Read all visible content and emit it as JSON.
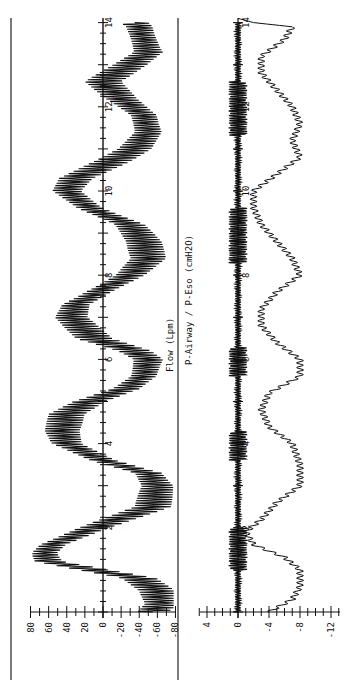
{
  "figure": {
    "orientation": "rotated-90-ccw",
    "ink_color": "#111111",
    "background": "#ffffff"
  },
  "panels": {
    "flow": {
      "title": "Flow (Lpm)",
      "y_ticks": [
        "80",
        "60",
        "40",
        "20",
        "0",
        "-20",
        "-40",
        "-60",
        "-80"
      ],
      "time_ticks": [
        "2",
        "4",
        "6",
        "8",
        "10",
        "12",
        "14"
      ]
    },
    "pressure": {
      "title": "P-Airway / P-Eso (cmH2O)",
      "y_ticks": [
        "4",
        "0",
        "-4",
        "-8",
        "-12"
      ],
      "time_ticks": [
        "2",
        "4",
        "6",
        "8",
        "10",
        "12",
        "14"
      ]
    }
  },
  "chart_data": [
    {
      "type": "line",
      "title": "Flow (Lpm)",
      "xlabel": "Time (s)",
      "ylabel": "Flow (Lpm)",
      "xlim": [
        0,
        14.2
      ],
      "ylim": [
        -80,
        80
      ],
      "x_ticks": [
        2,
        4,
        6,
        8,
        10,
        12,
        14
      ],
      "y_ticks": [
        80,
        60,
        40,
        20,
        0,
        -20,
        -40,
        -60,
        -80
      ],
      "grid": false,
      "note": "Breathing flow signal with superimposed high-frequency oscillation (~18 Hz band, amplitude ~ +/-20 Lpm). Values below are the slow envelope center.",
      "series": [
        {
          "name": "Flow envelope (center)",
          "x": [
            0.0,
            0.2,
            0.5,
            0.8,
            1.0,
            1.2,
            1.4,
            1.6,
            2.0,
            2.5,
            3.0,
            3.3,
            3.6,
            4.0,
            4.3,
            4.7,
            5.0,
            5.3,
            5.6,
            6.0,
            6.2,
            6.5,
            7.0,
            7.3,
            7.6,
            8.0,
            8.4,
            8.8,
            9.2,
            9.6,
            10.0,
            10.3,
            10.7,
            11.0,
            11.4,
            11.8,
            12.2,
            12.6,
            13.0,
            13.3,
            13.6,
            13.9,
            14.0
          ],
          "y": [
            -55,
            -65,
            -60,
            -40,
            10,
            60,
            65,
            55,
            10,
            -55,
            -60,
            -50,
            0,
            40,
            45,
            40,
            15,
            -25,
            -45,
            -50,
            -35,
            10,
            35,
            30,
            5,
            -30,
            -50,
            -45,
            -30,
            15,
            40,
            30,
            -10,
            -35,
            -50,
            -45,
            -20,
            0,
            -30,
            -50,
            -45,
            -40,
            -35
          ]
        },
        {
          "name": "HF oscillation amplitude",
          "x": [
            0,
            14
          ],
          "y": [
            20,
            20
          ]
        }
      ]
    },
    {
      "type": "line",
      "title": "P-Airway / P-Eso (cmH2O)",
      "xlabel": "Time (s)",
      "ylabel": "Pressure (cmH2O)",
      "xlim": [
        0,
        14.2
      ],
      "ylim": [
        -13,
        5
      ],
      "x_ticks": [
        2,
        4,
        6,
        8,
        10,
        12,
        14
      ],
      "y_ticks": [
        4,
        0,
        -4,
        -8,
        -12
      ],
      "grid": false,
      "series": [
        {
          "name": "P-Airway",
          "x": [
            0,
            2,
            4,
            6,
            8,
            10,
            12,
            14
          ],
          "y": [
            0,
            0,
            0,
            0,
            0,
            0,
            0,
            0
          ],
          "note": "Oscillates around 0 with amplitude ~ +/-1 cmH2O, larger bursts near t=1.5, 4, 6, 8.5-9.5, 11.5-12.5"
        },
        {
          "name": "P-Eso",
          "x": [
            0.0,
            0.3,
            0.6,
            1.0,
            1.3,
            1.6,
            1.9,
            2.2,
            2.6,
            3.0,
            3.5,
            4.0,
            4.4,
            4.8,
            5.2,
            5.6,
            6.0,
            6.4,
            6.8,
            7.2,
            7.6,
            8.0,
            8.4,
            8.8,
            9.2,
            9.6,
            10.0,
            10.4,
            10.8,
            11.2,
            11.6,
            12.0,
            12.4,
            12.8,
            13.2,
            13.6,
            13.9,
            14.0,
            14.1
          ],
          "y": [
            -4,
            -7,
            -8,
            -8,
            -6,
            -2,
            -1,
            -3,
            -5,
            -8,
            -8,
            -7,
            -4,
            -3,
            -4,
            -8,
            -8,
            -5,
            -3,
            -3,
            -5,
            -8,
            -7,
            -5,
            -3,
            -2,
            -2,
            -5,
            -8,
            -7,
            -8,
            -7,
            -5,
            -3,
            -3,
            -6,
            -7,
            -2,
            0
          ]
        }
      ]
    }
  ]
}
